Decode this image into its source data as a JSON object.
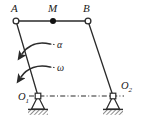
{
  "figure": {
    "type": "four-bar-linkage-kinematic-diagram",
    "background_color": "#ffffff",
    "line_color": "#2b2b2b",
    "label_color": "#1a1a1a",
    "joint_fill_open": "#ffffff",
    "joint_fill_solid": "#111111"
  },
  "labels": {
    "point_a": "A",
    "point_m": "M",
    "point_b": "B",
    "angular_acceleration": "α",
    "angular_velocity": "ω",
    "pivot_o1": "O",
    "pivot_o1_sub": "1",
    "pivot_o2": "O",
    "pivot_o2_sub": "2"
  },
  "geometry": {
    "point_a": {
      "x": 16,
      "y": 21
    },
    "point_m": {
      "x": 53,
      "y": 21
    },
    "point_b": {
      "x": 88,
      "y": 21
    },
    "pivot_o1": {
      "x": 38,
      "y": 96
    },
    "pivot_o2": {
      "x": 113,
      "y": 96
    },
    "coupler_ab": {
      "from": "A",
      "to": "B"
    },
    "crank_a_o1": {
      "from": "A",
      "to": "O1"
    },
    "rocker_b_o2": {
      "from": "B",
      "to": "O2"
    },
    "ground_line": {
      "from": "O1",
      "to": "O2",
      "style": "dash-dot"
    }
  },
  "arrows": {
    "alpha_arrow": {
      "label": "α",
      "direction": "counterclockwise",
      "label_x": 57,
      "label_y": 47
    },
    "omega_arrow": {
      "label": "ω",
      "direction": "counterclockwise",
      "label_x": 57,
      "label_y": 70
    }
  },
  "supports": {
    "o1": {
      "kind": "pin-support-hatched-ground",
      "x": 38,
      "y": 96
    },
    "o2": {
      "kind": "pin-support-hatched-ground",
      "x": 113,
      "y": 96
    }
  }
}
